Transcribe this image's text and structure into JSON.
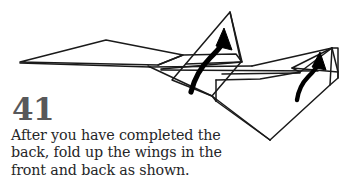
{
  "page": {
    "background_color": "#ffffff",
    "ink_color": "#1a1a1a",
    "step_number_color": "#58585a",
    "caption_color": "#262628"
  },
  "step": {
    "number": "41",
    "caption_lines": [
      "After you have completed the",
      "back, fold up the wings in the",
      "front and back as shown."
    ],
    "caption_full": "After you have completed the back, fold up the wings in the front and back as shown."
  },
  "diagram": {
    "annotations": [
      {
        "name": "front-wing-fold-arrow",
        "meaning": "fold up front wing",
        "direction": "up"
      },
      {
        "name": "back-wing-fold-arrow",
        "meaning": "fold up back wing",
        "direction": "up"
      }
    ],
    "parts": [
      {
        "name": "nose-point"
      },
      {
        "name": "left-main-wing"
      },
      {
        "name": "front-vertical-wing-flap"
      },
      {
        "name": "rear-vertical-wing-flap"
      },
      {
        "name": "fuselage-body"
      },
      {
        "name": "tail-section"
      }
    ]
  }
}
